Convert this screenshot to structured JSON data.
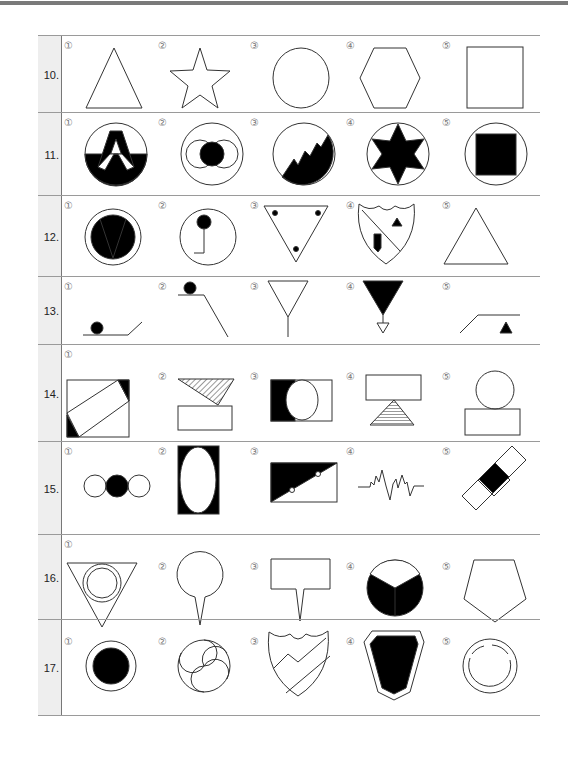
{
  "markers": [
    "①",
    "②",
    "③",
    "④",
    "⑤"
  ],
  "questions": [
    {
      "number": "10.",
      "options": [
        "triangle",
        "five-point star",
        "circle",
        "hexagon",
        "square"
      ]
    },
    {
      "number": "11.",
      "options": [
        "circle with letter A half-black",
        "circle with black dot between two rings",
        "circle with black mountain",
        "circle with black six-point star",
        "circle with black square"
      ]
    },
    {
      "number": "12.",
      "options": [
        "circle with black V disc",
        "circle with pin and bent stem",
        "inverted triangle with three dots",
        "shield with diagonal bar, triangle, and block",
        "triangle"
      ]
    },
    {
      "number": "13.",
      "options": [
        "ball on ground with ramp",
        "ball on ledge with slope",
        "funnel on stem",
        "black inverted triangle with small triangle",
        "ramp with black triangle"
      ]
    },
    {
      "number": "14.",
      "options": [
        "square with tilted rectangle",
        "hatched triangle over rectangle",
        "rectangle with black half and circle",
        "rectangle over hatched triangle",
        "circle over rectangle"
      ]
    },
    {
      "number": "15.",
      "options": [
        "three circles middle black",
        "black rectangle with white ellipse",
        "rectangle diagonally half black with two dots",
        "zigzag waveform",
        "diagonal band with black center"
      ]
    },
    {
      "number": "16.",
      "options": [
        "inverted triangle with double circle",
        "circle pin",
        "rectangle signpost spike",
        "black circle divided in three",
        "pentagon"
      ]
    },
    {
      "number": "17.",
      "options": [
        "black disc with ring",
        "three-swirl circle",
        "shield with zigzag stripes",
        "black shield in outline",
        "broken ring in circle"
      ]
    }
  ]
}
